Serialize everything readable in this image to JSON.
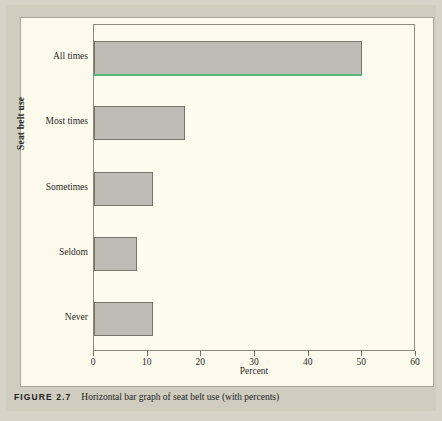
{
  "figure": {
    "number_label": "FIGURE 2.7",
    "caption": "Horizontal bar graph of seat belt use (with percents)"
  },
  "colors": {
    "page_background": "#d6d4c8",
    "panel_background": "#fbfaec",
    "plot_background": "#fcfbef",
    "bar_fill": "#bdbdb6",
    "bar_outline": "#77766b",
    "artifact_green_line": "#55b57a",
    "axis": "#8d8b7d",
    "text": "#2b2b28"
  },
  "chart_data": {
    "type": "bar",
    "orientation": "horizontal",
    "title": "",
    "xlabel": "Percent",
    "ylabel": "Seat belt use",
    "categories": [
      "All times",
      "Most times",
      "Sometimes",
      "Seldom",
      "Never"
    ],
    "values": [
      50,
      17,
      11,
      8,
      11
    ],
    "xlim": [
      0,
      60
    ],
    "xticks": [
      0,
      10,
      20,
      30,
      40,
      50,
      60
    ],
    "xtick_labels": [
      "0",
      "10",
      "20",
      "30",
      "40",
      "50",
      "60"
    ],
    "grid": false,
    "legend": null,
    "annotations": [
      {
        "name": "green-scan-line",
        "description": "Thin green line along the bottom edge of the All times bar",
        "category": "All times"
      }
    ]
  }
}
